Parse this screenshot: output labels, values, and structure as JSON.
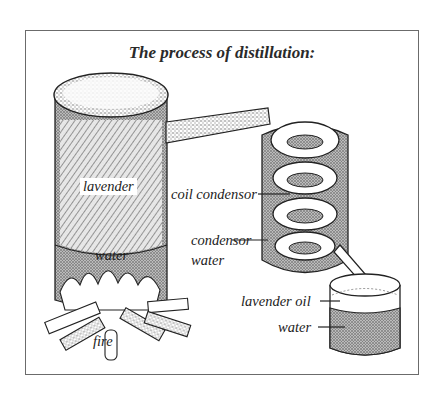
{
  "diagram": {
    "title": "The process of distillation:",
    "components": [
      {
        "id": "still-pot",
        "contents": [
          "lavender",
          "water"
        ],
        "heated_by": "fire"
      },
      {
        "id": "pipe",
        "connects": [
          "still-pot",
          "coil-condensor"
        ]
      },
      {
        "id": "coil-condensor",
        "surrounded_by": "condensor water"
      },
      {
        "id": "collection-vessel",
        "layers": [
          "lavender oil",
          "water"
        ]
      }
    ],
    "labels": {
      "lavender": "lavender",
      "water_pot": "water",
      "fire": "fire",
      "coil_condensor": "coil condensor",
      "condensor_water_line1": "condensor",
      "condensor_water_line2": "water",
      "lavender_oil": "lavender oil",
      "water_vessel": "water"
    },
    "colors": {
      "ink": "#222222",
      "frame": "#6b6b6b",
      "stipple": "#8a8a8a",
      "background": "#ffffff"
    }
  }
}
